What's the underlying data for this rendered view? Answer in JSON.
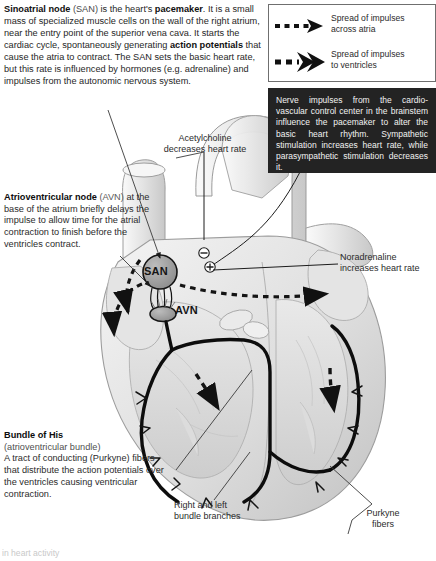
{
  "intro": {
    "segments": [
      {
        "t": "Sinoatrial node",
        "style": "bold"
      },
      {
        "t": " (SAN)",
        "style": "light"
      },
      {
        "t": " is the heart's ",
        "style": "normal"
      },
      {
        "t": "pacemaker",
        "style": "bold"
      },
      {
        "t": ". It is a small mass of specialized muscle cells on the wall of the right atrium, near the entry point of the superior vena cava. It starts the cardiac cycle, spontaneously generating ",
        "style": "normal"
      },
      {
        "t": "action potentials",
        "style": "bold"
      },
      {
        "t": " that cause the atria to contract. The SAN sets the basic heart rate, but this rate is influenced by hormones (e.g. adrenaline) and impulses from the autonomic nervous system.",
        "style": "normal"
      }
    ],
    "plain": "Sinoatrial node (SAN) is the heart's pacemaker. It is a small mass of specialized muscle cells on the wall of the right atrium, near the entry point of the superior vena cava. It starts the cardiac cycle, spontaneously generating action potentials that cause the atria to contract. The SAN sets the basic heart rate, but this rate is influenced by hormones (e.g. adrenaline) and impulses from the autonomic nervous system."
  },
  "legend": {
    "entries": [
      {
        "icon": "dashed-arrow-thin-icon",
        "line1": "Spread of impulses",
        "line2": "across atria",
        "text": "Spread of impulses across atria"
      },
      {
        "icon": "dashed-double-arrow-bold-icon",
        "line1": "Spread of impulses",
        "line2": "to ventricles",
        "text": "Spread of impulses to ventricles"
      }
    ]
  },
  "blackbox": {
    "text": "Nerve impulses from the cardio-vascular control center in the brainstem influence the pacemaker to alter the basic heart rhythm. Sympathetic stimulation increases heart rate, while parasympathetic stimulation decreases it."
  },
  "avn_note": {
    "heading": "Atrioventricular node",
    "heading_suffix": " (AVN)",
    "body": "at the base of the atrium briefly delays the impulse to allow time for the atrial contraction to finish before the ventricles contract."
  },
  "his_note": {
    "heading": "Bundle of His",
    "subheading": "(atrioventricular bundle)",
    "body": "A tract of conducting (Purkyne) fibers that distribute the action potentials over the ventricles causing ventricular contraction."
  },
  "labels": {
    "acetylcholine": "Acetylcholine decreases heart rate",
    "acetylcholine_l1": "Acetylcholine",
    "acetylcholine_l2": "decreases heart rate",
    "noradrenaline": "Noradrenaline increases heart rate",
    "noradrenaline_l1": "Noradrenaline",
    "noradrenaline_l2": "increases heart rate",
    "bundle_branches": "Right and left bundle branches",
    "bundle_branches_l1": "Right and left",
    "bundle_branches_l2": "bundle branches",
    "purkyne": "Purkyne fibers",
    "purkyne_l1": "Purkyne",
    "purkyne_l2": "fibers",
    "footer_cropped": "in heart activity",
    "san": "SAN",
    "avn": "AVN"
  },
  "colors": {
    "page_background": "#ffffff",
    "text": "#262626",
    "black_box_fill": "#232323",
    "black_box_text": "#f2f2f2",
    "legend_border": "#6f6f6f",
    "node_fill": "#9a9a9a",
    "node_stroke": "#1a1a1a",
    "conduction_path": "#0d0d0d",
    "heart_light": "#f0f0f0",
    "heart_mid": "#d8d8d8",
    "heart_dark": "#b8b8b8"
  }
}
